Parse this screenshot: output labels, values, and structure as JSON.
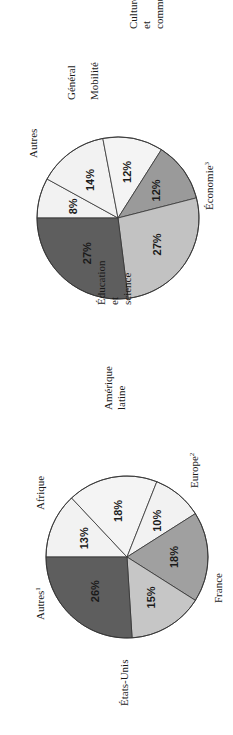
{
  "chart_data": [
    {
      "type": "pie",
      "title": "",
      "orientation": "rotated 90° counter-clockwise on page",
      "center": [
        118,
        218
      ],
      "radius": 81,
      "start_angle_deg": 180,
      "direction": "clockwise-in-image",
      "slices": [
        {
          "label": "Mobilité",
          "value": 8,
          "display": "8%",
          "color": "#f2f2f2"
        },
        {
          "label": "Autres",
          "value": 14,
          "display": "14%",
          "color": "#f2f2f2"
        },
        {
          "label": "Général",
          "value": 12,
          "display": "12%",
          "color": "#f4f4f4"
        },
        {
          "label": "Culture et communications",
          "value": 12,
          "display": "12%",
          "color": "#9a9a9a"
        },
        {
          "label": "Économie",
          "sup": "3",
          "value": 27,
          "display": "27%",
          "color": "#c2c2c2"
        },
        {
          "label": "Éducation et science",
          "value": 27,
          "display": "27%",
          "color": "#5e5e5e"
        }
      ],
      "labels": [
        {
          "lines": [
            "Mobilité"
          ],
          "x": 98,
          "y": 100
        },
        {
          "lines": [
            "Autres"
          ],
          "x": 37,
          "y": 158
        },
        {
          "lines": [
            "Général"
          ],
          "x": 75,
          "y": 100
        },
        {
          "lines": [
            "Culture",
            "et",
            "communications"
          ],
          "x": 137,
          "y": 29
        },
        {
          "lines": [
            "Économie"
          ],
          "sup": "3",
          "x": 213,
          "y": 210
        },
        {
          "lines": [
            "Éducation",
            "et",
            "science"
          ],
          "x": 105,
          "y": 305
        }
      ]
    },
    {
      "type": "pie",
      "title": "",
      "orientation": "rotated 90° counter-clockwise on page",
      "center": [
        127,
        557
      ],
      "radius": 81,
      "start_angle_deg": 180,
      "direction": "clockwise-in-image",
      "slices": [
        {
          "label": "Autres",
          "sup": "1",
          "value": 13,
          "display": "13%",
          "color": "#f2f2f2"
        },
        {
          "label": "Afrique",
          "value": 18,
          "display": "18%",
          "color": "#f4f4f4"
        },
        {
          "label": "Amérique latine",
          "value": 10,
          "display": "10%",
          "color": "#f2f2f2"
        },
        {
          "label": "Europe",
          "sup": "2",
          "value": 18,
          "display": "18%",
          "color": "#a0a0a0"
        },
        {
          "label": "France",
          "value": 15,
          "display": "15%",
          "color": "#c6c6c6"
        },
        {
          "label": "États-Unis",
          "value": 26,
          "display": "26%",
          "color": "#5e5e5e"
        }
      ],
      "labels": [
        {
          "lines": [
            "Autres"
          ],
          "sup": "1",
          "x": 44,
          "y": 620
        },
        {
          "lines": [
            "Afrique"
          ],
          "x": 44,
          "y": 510
        },
        {
          "lines": [
            "Amérique",
            "latine"
          ],
          "x": 112,
          "y": 410
        },
        {
          "lines": [
            "Europe"
          ],
          "sup": "2",
          "x": 198,
          "y": 488
        },
        {
          "lines": [
            "France"
          ],
          "x": 222,
          "y": 603
        },
        {
          "lines": [
            "États-Unis"
          ],
          "x": 128,
          "y": 706
        }
      ]
    }
  ]
}
